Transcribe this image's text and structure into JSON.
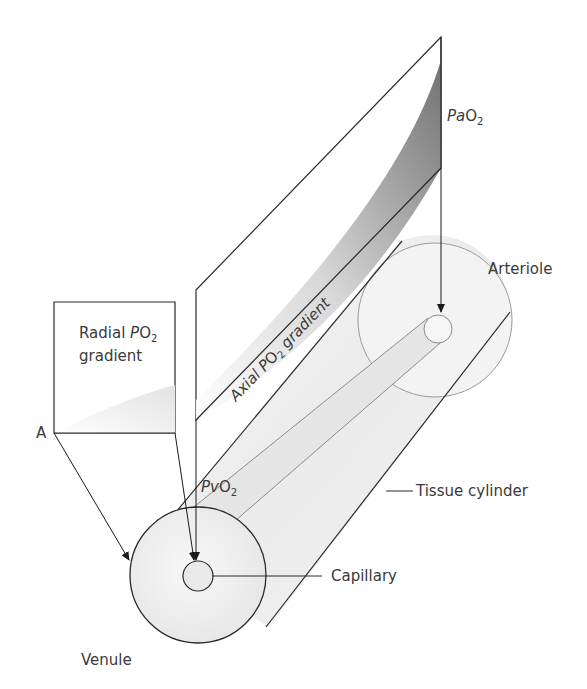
{
  "diagram": {
    "type": "anatomical-schematic",
    "labels": {
      "axial_gradient": {
        "prefix": "Axial ",
        "italic": "P",
        "o": "O",
        "sub": "2",
        "suffix": " gradient"
      },
      "radial_gradient_line1": {
        "text": "Radial ",
        "italic": "P",
        "o": "O",
        "sub": "2"
      },
      "radial_gradient_line2": "gradient",
      "pao2": {
        "italic": "Pa",
        "main": "O",
        "sub": "2"
      },
      "pvo2": {
        "italic": "Pv",
        "main": "O",
        "sub": "2"
      },
      "arteriole": "Arteriole",
      "venule": "Venule",
      "tissue_cylinder": "Tissue cylinder",
      "capillary": "Capillary",
      "point_a": "A"
    },
    "colors": {
      "stroke": "#2a2a2a",
      "light_stroke": "#8a8a8a",
      "gradient_dark": "#6e6e6e",
      "gradient_light": "#ffffff",
      "text": "#3a3a3a",
      "cylinder_fill": "#f2f2f2"
    }
  }
}
